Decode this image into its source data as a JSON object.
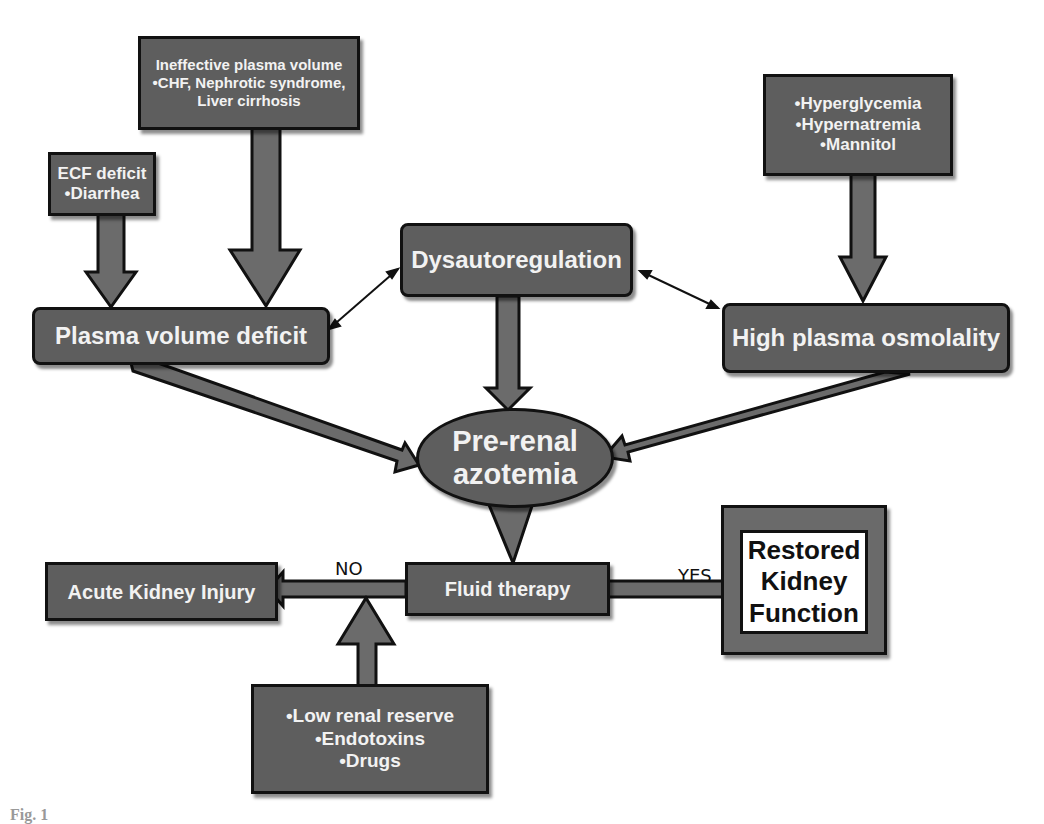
{
  "diagram": {
    "nodes": {
      "ineffective_plasma": {
        "lines": [
          "Ineffective plasma volume",
          "•CHF, Nephrotic syndrome,",
          "Liver cirrhosis"
        ]
      },
      "ecf_deficit": {
        "lines": [
          "ECF deficit",
          "•Diarrhea"
        ]
      },
      "osmolality_causes": {
        "lines": [
          "•Hyperglycemia",
          "•Hypernatremia",
          "•Mannitol"
        ]
      },
      "plasma_volume_deficit": {
        "label": "Plasma volume deficit"
      },
      "dysautoregulation": {
        "label": "Dysautoregulation"
      },
      "high_plasma_osmolality": {
        "label": "High plasma osmolality"
      },
      "pre_renal_azotemia": {
        "lines": [
          "Pre-renal",
          "azotemia"
        ]
      },
      "fluid_therapy": {
        "label": "Fluid therapy"
      },
      "acute_kidney_injury": {
        "label": "Acute Kidney Injury"
      },
      "restored_kidney_function": {
        "lines": [
          "Restored",
          "Kidney",
          "Function"
        ]
      },
      "risk_factors": {
        "lines": [
          "•Low renal reserve",
          "•Endotoxins",
          "•Drugs"
        ]
      }
    },
    "edge_labels": {
      "no": "NO",
      "yes": "YES"
    },
    "edges": [
      {
        "from": "ecf_deficit",
        "to": "plasma_volume_deficit",
        "style": "block-arrow"
      },
      {
        "from": "ineffective_plasma",
        "to": "plasma_volume_deficit",
        "style": "block-arrow"
      },
      {
        "from": "osmolality_causes",
        "to": "high_plasma_osmolality",
        "style": "block-arrow"
      },
      {
        "from": "plasma_volume_deficit",
        "to": "dysautoregulation",
        "style": "double-headed-thin"
      },
      {
        "from": "high_plasma_osmolality",
        "to": "dysautoregulation",
        "style": "double-headed-thin"
      },
      {
        "from": "dysautoregulation",
        "to": "pre_renal_azotemia",
        "style": "block-arrow"
      },
      {
        "from": "plasma_volume_deficit",
        "to": "pre_renal_azotemia",
        "style": "block-arrow"
      },
      {
        "from": "high_plasma_osmolality",
        "to": "pre_renal_azotemia",
        "style": "block-arrow"
      },
      {
        "from": "pre_renal_azotemia",
        "to": "fluid_therapy",
        "style": "wedge"
      },
      {
        "from": "fluid_therapy",
        "to": "acute_kidney_injury",
        "label": "NO",
        "style": "block-arrow"
      },
      {
        "from": "fluid_therapy",
        "to": "restored_kidney_function",
        "label": "YES",
        "style": "block-arrow"
      },
      {
        "from": "risk_factors",
        "to": "acute_kidney_injury",
        "style": "block-arrow"
      }
    ],
    "colors": {
      "box_fill": "#5e5e5e",
      "box_border": "#111111",
      "text": "#f2f2f2",
      "background": "#ffffff"
    }
  },
  "caption": {
    "text": "Fig. 1"
  }
}
